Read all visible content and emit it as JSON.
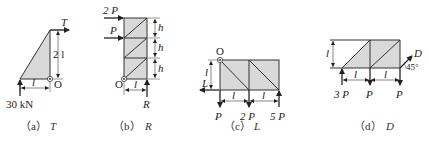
{
  "figures": [
    {
      "id": "a",
      "caption_tag": "（a）",
      "caption_var": "T",
      "labels": {
        "top_force": "T",
        "height_dim": "2 l",
        "width_dim": "l",
        "origin": "O",
        "bottom_force": "30 kN"
      }
    },
    {
      "id": "b",
      "caption_tag": "（b）",
      "caption_var": "R",
      "labels": {
        "force_top": "2 P",
        "force_mid": "P",
        "panel_dims": [
          "h",
          "h",
          "h"
        ],
        "width_dim": "l",
        "origin": "O",
        "reaction": "R"
      }
    },
    {
      "id": "c",
      "caption_tag": "（c）",
      "caption_var": "L",
      "labels": {
        "origin": "O",
        "height_dim": "l",
        "left_force": "L",
        "width_dims": [
          "l",
          "l"
        ],
        "bottom_forces": [
          "P",
          "2 P",
          "5 P"
        ]
      }
    },
    {
      "id": "d",
      "caption_tag": "（d）",
      "caption_var": "D",
      "labels": {
        "height_dim": "l",
        "width_dims": [
          "l",
          "l"
        ],
        "bottom_forces": [
          "3 P",
          "P",
          "P"
        ],
        "inclined_force": "D",
        "angle": "45°"
      }
    }
  ],
  "colors": {
    "line": "#333333",
    "fill": "#d9d9d9",
    "text": "#222222"
  }
}
